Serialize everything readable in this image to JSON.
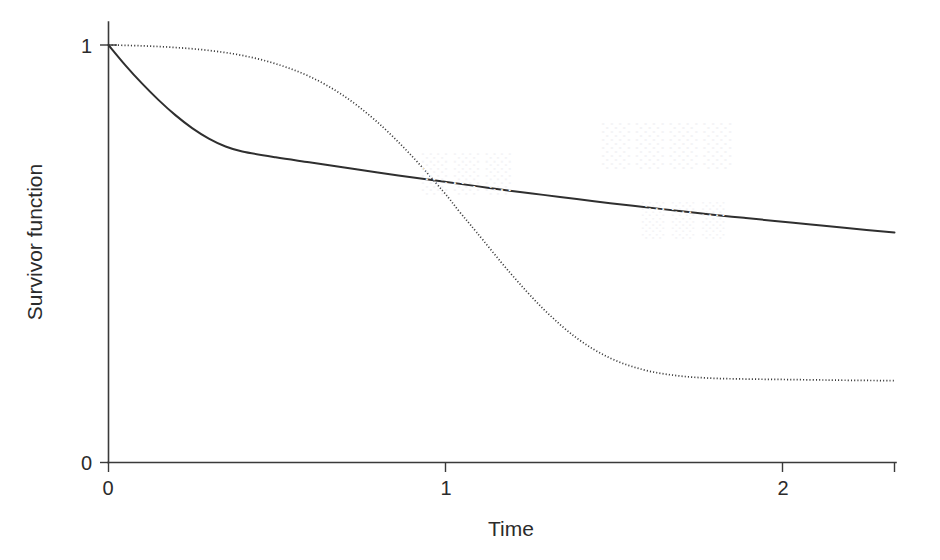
{
  "figure": {
    "background_color": "#ffffff",
    "ink_color": "#2f2f2f",
    "axis_color": "#3a3a3a"
  },
  "axes": {
    "x_title": "Time",
    "y_title": "Survivor function",
    "x_tick_labels": [
      "0",
      "1",
      "2"
    ],
    "y_tick_labels": [
      "0",
      "1"
    ]
  },
  "chart_data": {
    "type": "line",
    "title": "",
    "xlabel": "Time",
    "ylabel": "Survivor function",
    "xlim": [
      0,
      2.35
    ],
    "ylim": [
      0,
      1.05
    ],
    "grid": false,
    "legend": "none",
    "xticks": [
      0,
      1,
      2
    ],
    "yticks": [
      0,
      1
    ],
    "xtick_labels": [
      "0",
      "1",
      "2"
    ],
    "ytick_labels": [
      "0",
      "1"
    ],
    "series": [
      {
        "name": "solid-survivor-curve",
        "style": "solid",
        "color": "#2f2f2f",
        "x": [
          0,
          0.05,
          0.1,
          0.15,
          0.2,
          0.25,
          0.3,
          0.35,
          0.4,
          0.5,
          0.6,
          0.7,
          0.8,
          0.9,
          1.0,
          1.1,
          1.2,
          1.3,
          1.4,
          1.5,
          1.6,
          1.7,
          1.8,
          1.9,
          2.0,
          2.1,
          2.2,
          2.35
        ],
        "y": [
          1.0,
          0.952,
          0.908,
          0.868,
          0.832,
          0.801,
          0.776,
          0.757,
          0.745,
          0.731,
          0.719,
          0.707,
          0.695,
          0.684,
          0.673,
          0.662,
          0.651,
          0.641,
          0.631,
          0.621,
          0.612,
          0.603,
          0.594,
          0.586,
          0.578,
          0.57,
          0.562,
          0.551
        ]
      },
      {
        "name": "dotted-survivor-curve",
        "style": "dotted",
        "color": "#3a3a3a",
        "x": [
          0,
          0.1,
          0.2,
          0.3,
          0.4,
          0.5,
          0.6,
          0.7,
          0.8,
          0.9,
          1.0,
          1.05,
          1.1,
          1.2,
          1.3,
          1.4,
          1.5,
          1.6,
          1.7,
          1.8,
          1.9,
          2.0,
          2.1,
          2.2,
          2.35
        ],
        "y": [
          1.0,
          0.998,
          0.994,
          0.987,
          0.975,
          0.955,
          0.925,
          0.88,
          0.818,
          0.74,
          0.65,
          0.6,
          0.552,
          0.455,
          0.368,
          0.298,
          0.25,
          0.222,
          0.208,
          0.202,
          0.2,
          0.199,
          0.198,
          0.197,
          0.196
        ]
      }
    ],
    "annotations": [
      {
        "name": "curve-crossing",
        "x": 1.08,
        "y": 0.656,
        "note": "solid and dotted curves intersect"
      }
    ]
  },
  "bleed_through": {
    "visible": true,
    "note": "very faint reverse-side print showing through scanned page"
  }
}
